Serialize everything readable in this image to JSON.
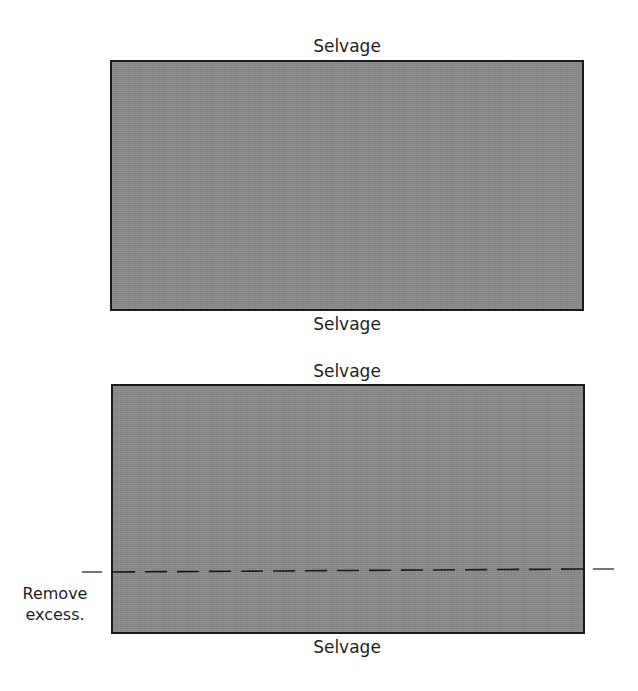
{
  "diagram": {
    "top_panel": {
      "top_label": "Selvage",
      "bottom_label": "Selvage"
    },
    "bottom_panel": {
      "top_label": "Selvage",
      "bottom_label": "Selvage",
      "cut_line_style": "dashed",
      "note_lines": [
        "Remove",
        "excess."
      ]
    },
    "colors": {
      "fabric_fill": "#8b8b8b",
      "outline": "#1a1a1a",
      "text": "#1e1e1e"
    }
  }
}
